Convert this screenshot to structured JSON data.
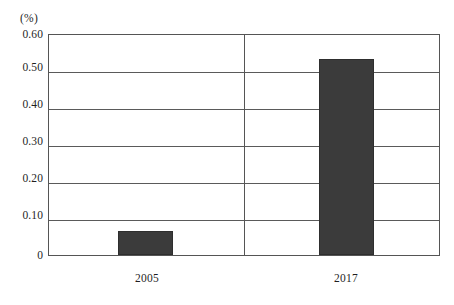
{
  "chart_data": {
    "type": "bar",
    "title": "",
    "subtitle": "",
    "xlabel": "",
    "ylabel": "(%)",
    "unit_label": "(%)",
    "categories": [
      "2005",
      "2017"
    ],
    "values": [
      0.065,
      0.535
    ],
    "series": [
      {
        "name": "",
        "values": [
          0.065,
          0.535
        ]
      }
    ],
    "ylim": [
      0,
      0.6
    ],
    "yticks": [
      "0",
      "0.10",
      "0.20",
      "0.30",
      "0.40",
      "0.50",
      "0.60"
    ],
    "ytick_values": [
      0,
      0.1,
      0.2,
      0.3,
      0.4,
      0.5,
      0.6
    ],
    "grid": true,
    "grid_axis": "y",
    "legend": null,
    "legend_position": "none",
    "annotations": [],
    "bar_color": "#3b3b3b",
    "frame_color": "#555555",
    "background_color": "#ffffff"
  },
  "axis": {
    "unit": "(%)",
    "y_labels": {
      "t6": "0.60",
      "t5": "0.50",
      "t4": "0.40",
      "t3": "0.30",
      "t2": "0.20",
      "t1": "0.10",
      "t0": "0"
    },
    "x_labels": {
      "c0": "2005",
      "c1": "2017"
    }
  }
}
